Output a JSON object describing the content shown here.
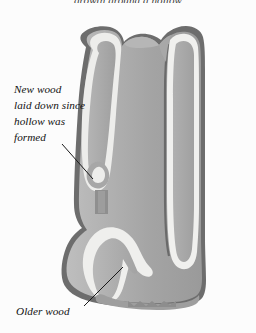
{
  "figure": {
    "title_partial": "growth around a hollow",
    "background_color": "#fcfcfc",
    "annotations": [
      {
        "id": "new-wood",
        "text": "New wood\nlaid down since\nhollow was\nformed",
        "leader": {
          "x1": 62,
          "y1": 144,
          "x2": 93,
          "y2": 179
        }
      },
      {
        "id": "older-wood",
        "text": "Older wood",
        "leader": {
          "x1": 84,
          "y1": 306,
          "x2": 123,
          "y2": 267
        }
      }
    ],
    "palette": {
      "outline_dark": "#6e6e6e",
      "outline_darker": "#5d5d5d",
      "cream_band": "#ececec",
      "cream_band_light": "#f4f4f2",
      "wood_mid": "#a9a9a9",
      "wood_mid_dark": "#9b9b9b",
      "wood_light": "#c3c3c3",
      "wood_core_light": "#bdbdbd",
      "wood_core_dark": "#a2a2a2",
      "leader_line": "#1a1a1a",
      "text": "#111111"
    },
    "parts": [
      {
        "name": "trunk-outer-bark-outline",
        "fill": "#6e6e6e"
      },
      {
        "name": "trunk-core-older-wood",
        "fill": "gradient mid gray"
      },
      {
        "name": "left-lobe-new-wood",
        "fill": "#ececec"
      },
      {
        "name": "right-column-new-wood",
        "fill": "#ececec"
      },
      {
        "name": "lower-left-lobe-new-wood",
        "fill": "#ececec"
      },
      {
        "name": "hollow-cavity",
        "fill": "#a9a9a9"
      },
      {
        "name": "trunk-top-lumpy-edge",
        "fill": "#6e6e6e"
      },
      {
        "name": "trunk-bottom-torn-edge",
        "fill": "#a9a9a9"
      }
    ]
  }
}
